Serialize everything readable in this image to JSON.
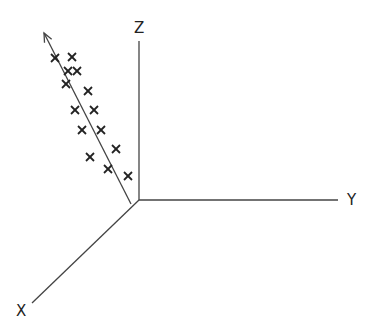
{
  "diagram": {
    "type": "3d-axes-scatter",
    "colors": {
      "axis": "#444444",
      "marker": "#222222",
      "background": "#ffffff"
    },
    "origin": [
      139,
      200
    ],
    "axes": [
      {
        "name": "Z",
        "label": "Z",
        "end": [
          139,
          41
        ],
        "label_pos": [
          134,
          21
        ]
      },
      {
        "name": "Y",
        "label": "Y",
        "end": [
          338,
          200
        ],
        "label_pos": [
          347,
          193
        ]
      },
      {
        "name": "X",
        "label": "X",
        "end": [
          32,
          303
        ],
        "label_pos": [
          16,
          304
        ]
      }
    ],
    "vector": {
      "start": [
        131,
        204
      ],
      "end": [
        44,
        33
      ],
      "arrow": true
    },
    "markers": [
      [
        55,
        58
      ],
      [
        72,
        57
      ],
      [
        68,
        71
      ],
      [
        77,
        71
      ],
      [
        66,
        84
      ],
      [
        88,
        91
      ],
      [
        75,
        110
      ],
      [
        94,
        110
      ],
      [
        82,
        130
      ],
      [
        101,
        130
      ],
      [
        90,
        157
      ],
      [
        116,
        149
      ],
      [
        108,
        169
      ],
      [
        128,
        176
      ]
    ],
    "marker_glyph": "×"
  }
}
